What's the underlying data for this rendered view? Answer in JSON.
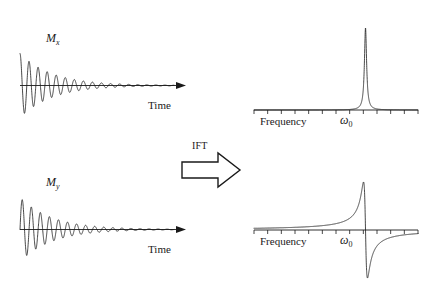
{
  "figure": {
    "background_color": "#ffffff",
    "stroke_color": "#1a1a1a"
  },
  "transform": {
    "label": "IFT",
    "arrow_direction": "right",
    "arrow_style": "hollow-block"
  },
  "panels": [
    {
      "id": "mx-fid",
      "role": "time-domain",
      "magnetization_label": "M",
      "magnetization_subscript": "x",
      "axis_label": "Time",
      "axis_arrow": true
    },
    {
      "id": "my-fid",
      "role": "time-domain",
      "magnetization_label": "M",
      "magnetization_subscript": "y",
      "axis_label": "Time",
      "axis_arrow": true
    },
    {
      "id": "absorption-spectrum",
      "role": "frequency-domain",
      "axis_label": "Frequency",
      "peak_symbol": "ω",
      "peak_subscript": "0",
      "lineshape": "absorption"
    },
    {
      "id": "dispersion-spectrum",
      "role": "frequency-domain",
      "axis_label": "Frequency",
      "peak_symbol": "ω",
      "peak_subscript": "0",
      "lineshape": "dispersion"
    }
  ],
  "chart_data": [
    {
      "type": "line",
      "id": "mx-fid",
      "title": "",
      "xlabel": "Time",
      "ylabel": "",
      "series": [
        {
          "name": "Mx",
          "function": "damped_cosine",
          "amplitude": 1.0,
          "phase": "cosine",
          "decay_constant_T2": 0.21,
          "frequency_cycles": 17,
          "x_range": [
            0,
            1
          ],
          "y_range": [
            -1,
            1
          ]
        }
      ],
      "grid": false,
      "legend": "none",
      "annotations": [
        "M_x"
      ]
    },
    {
      "type": "line",
      "id": "my-fid",
      "title": "",
      "xlabel": "Time",
      "ylabel": "",
      "series": [
        {
          "name": "My",
          "function": "damped_sine",
          "amplitude": 1.0,
          "phase": "sine",
          "decay_constant_T2": 0.21,
          "frequency_cycles": 17,
          "x_range": [
            0,
            1
          ],
          "y_range": [
            -1,
            1
          ]
        }
      ],
      "grid": false,
      "legend": "none",
      "annotations": [
        "M_y"
      ]
    },
    {
      "type": "line",
      "id": "absorption-spectrum",
      "title": "",
      "xlabel": "Frequency",
      "ylabel": "",
      "series": [
        {
          "name": "Absorption Lorentzian",
          "function": "lorentzian_absorption",
          "center": 0.68,
          "halfwidth": 0.008,
          "peak_height": 1.0,
          "x_range": [
            0,
            1
          ],
          "y_range": [
            0,
            1
          ]
        }
      ],
      "axis_ticks": 12,
      "grid": false,
      "legend": "none",
      "annotations": [
        "ω₀"
      ]
    },
    {
      "type": "line",
      "id": "dispersion-spectrum",
      "title": "",
      "xlabel": "Frequency",
      "ylabel": "",
      "series": [
        {
          "name": "Dispersion Lorentzian",
          "function": "lorentzian_dispersion",
          "center": 0.68,
          "halfwidth": 0.012,
          "peak_height": 1.0,
          "x_range": [
            0,
            1
          ],
          "y_range": [
            -1,
            1
          ]
        }
      ],
      "axis_ticks": 12,
      "grid": false,
      "legend": "none",
      "annotations": [
        "ω₀"
      ]
    }
  ]
}
